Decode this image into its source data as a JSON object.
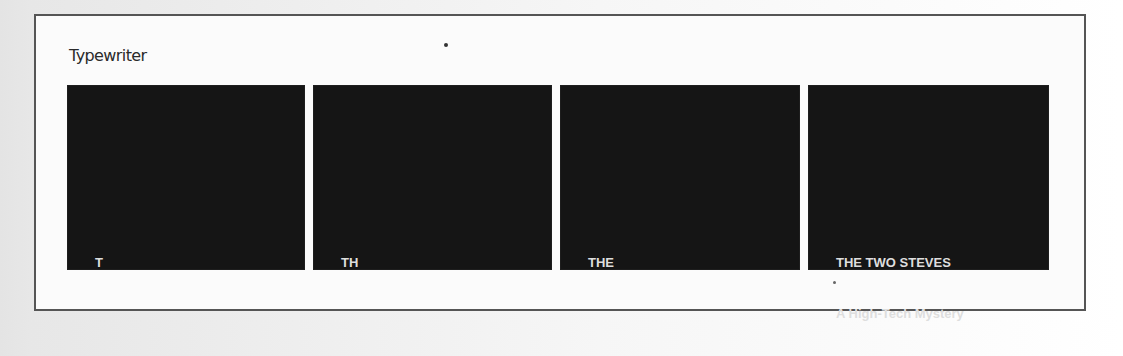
{
  "figure": {
    "title": "Typewriter",
    "panels": [
      {
        "lines": [
          "T"
        ]
      },
      {
        "lines": [
          "TH"
        ]
      },
      {
        "lines": [
          "THE"
        ]
      },
      {
        "lines": [
          "THE TWO STEVES",
          "A High-Tech Mystery"
        ]
      }
    ]
  },
  "colors": {
    "panel_background": "#151515",
    "panel_text": "#dedede",
    "frame_border": "#555555",
    "frame_background": "#fbfbfb"
  }
}
